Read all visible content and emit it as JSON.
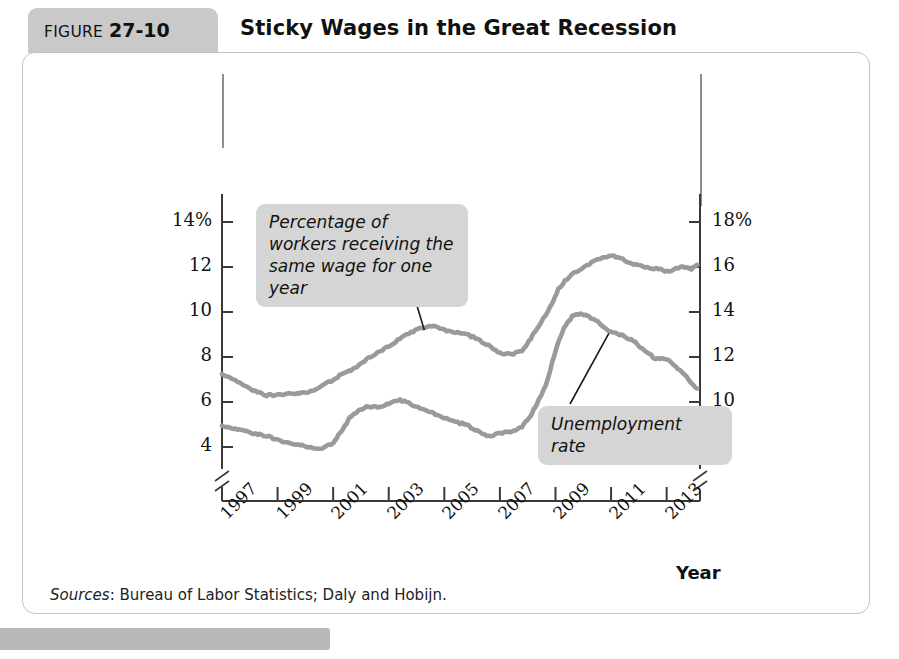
{
  "header": {
    "figure_word": "FIGURE",
    "figure_number": "27-10",
    "title": "Sticky Wages in the Great Recession"
  },
  "axes": {
    "y_left_title": "Unemployment\nrate",
    "y_right_title": "Percentage\nof workers\nreceiving the\nsame wage\nfor one year",
    "x_title": "Year",
    "y_left_ticks": [
      "14%",
      "12",
      "10",
      "8",
      "6",
      "4"
    ],
    "y_right_ticks": [
      "18%",
      "16",
      "14",
      "12",
      "10",
      "8"
    ],
    "x_ticks": [
      "1997",
      "1999",
      "2001",
      "2003",
      "2005",
      "2007",
      "2009",
      "2011",
      "2013"
    ]
  },
  "callouts": {
    "sticky": "Percentage of workers receiving the same wage for one year",
    "unemployment": "Unemployment rate"
  },
  "footer": {
    "sources_label": "Sources",
    "sources_text": ": Bureau of Labor Statistics; Daly and Hobijn."
  },
  "colors": {
    "line": "#9a9a9a",
    "axis": "#3a3a3a",
    "callout_bg": "#d5d5d5",
    "badge_bg": "#c9c9c9",
    "panel_border": "#c2c2c2"
  },
  "chart_data": {
    "type": "line",
    "title": "Sticky Wages in the Great Recession",
    "xlabel": "Year",
    "ylabel": "Unemployment rate",
    "y2label": "Percentage of workers receiving the same wage for one year",
    "xlim": [
      1997.0,
      2014.2
    ],
    "ylim": [
      3.0,
      15.0
    ],
    "y2lim": [
      7.0,
      19.0
    ],
    "grid": false,
    "legend": "annotations",
    "axis_break": true,
    "series": [
      {
        "name": "Unemployment rate",
        "axis": "left",
        "units": "percent",
        "x": [
          1997.0,
          1997.4,
          1997.8,
          1998.2,
          1998.6,
          1999.0,
          1999.4,
          1999.8,
          2000.2,
          2000.6,
          2001.0,
          2001.3,
          2001.6,
          2001.9,
          2002.2,
          2002.6,
          2003.0,
          2003.4,
          2003.8,
          2004.2,
          2004.6,
          2005.0,
          2005.4,
          2005.8,
          2006.2,
          2006.6,
          2007.0,
          2007.4,
          2007.8,
          2008.1,
          2008.4,
          2008.7,
          2009.0,
          2009.3,
          2009.6,
          2009.9,
          2010.2,
          2010.6,
          2011.0,
          2011.4,
          2011.8,
          2012.2,
          2012.6,
          2013.0,
          2013.4,
          2013.8,
          2014.1
        ],
        "y": [
          4.9,
          4.8,
          4.7,
          4.6,
          4.5,
          4.3,
          4.2,
          4.1,
          4.0,
          3.9,
          4.2,
          4.7,
          5.3,
          5.6,
          5.8,
          5.8,
          5.9,
          6.1,
          5.9,
          5.7,
          5.5,
          5.3,
          5.1,
          5.0,
          4.7,
          4.5,
          4.6,
          4.7,
          4.9,
          5.4,
          6.1,
          6.9,
          8.3,
          9.3,
          9.8,
          9.9,
          9.8,
          9.5,
          9.1,
          9.0,
          8.7,
          8.3,
          7.9,
          7.9,
          7.5,
          7.0,
          6.6
        ]
      },
      {
        "name": "Percentage of workers receiving the same wage for one year",
        "axis": "right",
        "units": "percent",
        "x": [
          1997.0,
          1997.4,
          1997.8,
          1998.2,
          1998.6,
          1999.0,
          1999.4,
          1999.8,
          2000.2,
          2000.6,
          2001.0,
          2001.4,
          2001.8,
          2002.2,
          2002.6,
          2003.0,
          2003.4,
          2003.8,
          2004.2,
          2004.6,
          2005.0,
          2005.4,
          2005.8,
          2006.2,
          2006.6,
          2007.0,
          2007.4,
          2007.8,
          2008.1,
          2008.4,
          2008.8,
          2009.1,
          2009.5,
          2009.9,
          2010.3,
          2010.7,
          2011.1,
          2011.5,
          2011.9,
          2012.3,
          2012.7,
          2013.1,
          2013.5,
          2013.9,
          2014.1
        ],
        "y": [
          11.2,
          11.0,
          10.7,
          10.5,
          10.3,
          10.3,
          10.4,
          10.4,
          10.5,
          10.7,
          11.0,
          11.3,
          11.5,
          11.9,
          12.2,
          12.5,
          12.8,
          13.1,
          13.3,
          13.4,
          13.2,
          13.1,
          13.0,
          12.8,
          12.5,
          12.2,
          12.1,
          12.3,
          12.8,
          13.4,
          14.2,
          15.0,
          15.6,
          15.9,
          16.2,
          16.4,
          16.5,
          16.3,
          16.1,
          16.0,
          15.9,
          15.8,
          16.0,
          15.9,
          16.1
        ]
      }
    ],
    "annotations": [
      {
        "text": "Percentage of workers receiving the same wage for one year",
        "points_to_series": "Percentage of workers receiving the same wage for one year",
        "points_to_x": 2004.3
      },
      {
        "text": "Unemployment rate",
        "points_to_series": "Unemployment rate",
        "points_to_x": 2010.9
      }
    ]
  }
}
